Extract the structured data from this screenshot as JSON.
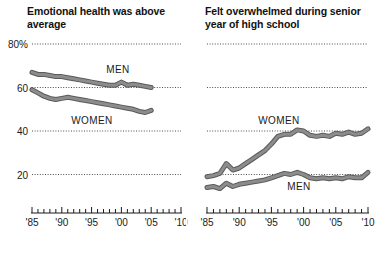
{
  "panels": [
    {
      "id": "emotional-health",
      "title": "Emotional health was above average",
      "y_ticks": [
        {
          "label": "80%",
          "value": 80
        },
        {
          "label": "60",
          "value": 60
        },
        {
          "label": "40",
          "value": 40
        },
        {
          "label": "20",
          "value": 20
        }
      ],
      "x_ticks": [
        "'85",
        "'90",
        "'95",
        "'00",
        "'05",
        "'10"
      ],
      "series_labels": [
        {
          "name": "MEN",
          "text": "MEN"
        },
        {
          "name": "WOMEN",
          "text": "WOMEN"
        }
      ]
    },
    {
      "id": "felt-overwhelmed",
      "title": "Felt overwhelmed during senior year of high school",
      "y_ticks": [
        {
          "label": "",
          "value": 80
        },
        {
          "label": "",
          "value": 60
        },
        {
          "label": "",
          "value": 40
        },
        {
          "label": "",
          "value": 20
        }
      ],
      "x_ticks": [
        "'85",
        "'90",
        "'95",
        "'00",
        "'05",
        "'10"
      ],
      "series_labels": [
        {
          "name": "WOMEN",
          "text": "WOMEN"
        },
        {
          "name": "MEN",
          "text": "MEN"
        }
      ]
    }
  ],
  "colors": {
    "line": "#8c8c8c",
    "line_outline": "#5a5a5a",
    "gridline": "#4d4d4d",
    "text": "#1a1a1a",
    "background": "#ffffff"
  },
  "chart_data": [
    {
      "type": "line",
      "title": "Emotional health was above average",
      "xlabel": "",
      "ylabel": "",
      "xlim": [
        1985,
        2010
      ],
      "ylim": [
        10,
        85
      ],
      "grid": true,
      "gridlines": [
        80,
        60,
        40,
        20
      ],
      "x_tick_labels": [
        "'85",
        "'90",
        "'95",
        "'00",
        "'05",
        "'10"
      ],
      "y_tick_labels": [
        "80%",
        "60",
        "40",
        "20"
      ],
      "legend": "inline-labels",
      "series": [
        {
          "name": "MEN",
          "x": [
            1985,
            1986,
            1987,
            1988,
            1989,
            1990,
            1991,
            1992,
            1993,
            1994,
            1995,
            1996,
            1997,
            1998,
            1999,
            2000,
            2001,
            2002,
            2003,
            2004,
            2005,
            2007,
            2008,
            2009,
            2010
          ],
          "values": [
            67,
            66,
            66,
            65.5,
            65,
            65,
            64.5,
            64,
            63.5,
            63,
            62.5,
            62,
            61.5,
            61,
            61,
            62.5,
            61,
            61.5,
            61,
            60.5,
            60,
            61.5,
            62,
            62,
            61
          ],
          "gap_after_year": 2005
        },
        {
          "name": "WOMEN",
          "x": [
            1985,
            1986,
            1987,
            1988,
            1989,
            1990,
            1991,
            1992,
            1993,
            1994,
            1995,
            1996,
            1997,
            1998,
            1999,
            2000,
            2001,
            2002,
            2003,
            2004,
            2005,
            2007,
            2008,
            2009,
            2010
          ],
          "values": [
            59,
            57.5,
            56,
            55,
            54.5,
            55,
            55.5,
            55,
            54.5,
            54,
            53.5,
            53,
            52.5,
            52,
            51.5,
            51,
            50.5,
            50,
            49,
            48.5,
            49.5,
            49,
            49,
            48.5,
            47
          ],
          "gap_after_year": 2005
        }
      ]
    },
    {
      "type": "line",
      "title": "Felt overwhelmed during senior year of high school",
      "xlabel": "",
      "ylabel": "",
      "xlim": [
        1985,
        2010
      ],
      "ylim": [
        10,
        85
      ],
      "grid": true,
      "gridlines": [
        80,
        60,
        40,
        20
      ],
      "x_tick_labels": [
        "'85",
        "'90",
        "'95",
        "'00",
        "'05",
        "'10"
      ],
      "y_tick_labels": [
        "",
        "",
        "",
        ""
      ],
      "legend": "inline-labels",
      "series": [
        {
          "name": "WOMEN",
          "x": [
            1985,
            1986,
            1987,
            1988,
            1989,
            1990,
            1991,
            1992,
            1993,
            1994,
            1995,
            1996,
            1997,
            1998,
            1999,
            2000,
            2001,
            2002,
            2003,
            2004,
            2005,
            2006,
            2007,
            2008,
            2009,
            2010
          ],
          "values": [
            19,
            19.5,
            20.5,
            25,
            22,
            23,
            25,
            27,
            29,
            31,
            34,
            37.5,
            38.5,
            38.5,
            40.5,
            40,
            38,
            37.5,
            38,
            37.5,
            39,
            38.5,
            39.5,
            38.5,
            39,
            41
          ]
        },
        {
          "name": "MEN",
          "x": [
            1985,
            1986,
            1987,
            1988,
            1989,
            1990,
            1991,
            1992,
            1993,
            1994,
            1995,
            1996,
            1997,
            1998,
            1999,
            2000,
            2001,
            2002,
            2003,
            2004,
            2005,
            2006,
            2007,
            2008,
            2009,
            2010
          ],
          "values": [
            14,
            14.5,
            13.5,
            16,
            14.5,
            15.5,
            16,
            16.5,
            17,
            17.5,
            18.5,
            19.5,
            20.5,
            20,
            21,
            20,
            18.5,
            18,
            18.5,
            18,
            18.5,
            18,
            19,
            18.5,
            18.5,
            21
          ]
        }
      ]
    }
  ]
}
